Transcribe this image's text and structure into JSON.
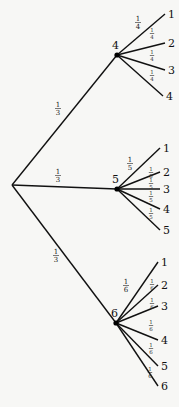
{
  "diagram": {
    "type": "probability-tree",
    "root": {
      "x": 12,
      "y": 185
    },
    "level1": [
      {
        "label": "4",
        "x": 117,
        "y": 55,
        "label_x": 112,
        "label_y": 49,
        "edge_prob": {
          "num": "1",
          "den": "3",
          "x": 58,
          "y": 108
        },
        "children": [
          {
            "label": "1",
            "x": 165,
            "y": 14,
            "prob": {
              "num": "1",
              "den": "4",
              "x": 138,
              "y": 22,
              "small": false
            }
          },
          {
            "label": "2",
            "x": 165,
            "y": 43,
            "prob": {
              "num": "1",
              "den": "4",
              "x": 152,
              "y": 33,
              "small": true
            }
          },
          {
            "label": "3",
            "x": 165,
            "y": 70,
            "prob": {
              "num": "1",
              "den": "4",
              "x": 152,
              "y": 55,
              "small": true
            }
          },
          {
            "label": "4",
            "x": 163,
            "y": 96,
            "prob": {
              "num": "1",
              "den": "4",
              "x": 152,
              "y": 75,
              "small": true
            }
          }
        ]
      },
      {
        "label": "5",
        "x": 117,
        "y": 189,
        "label_x": 112,
        "label_y": 183,
        "edge_prob": {
          "num": "1",
          "den": "3",
          "x": 58,
          "y": 175
        },
        "children": [
          {
            "label": "1",
            "x": 160,
            "y": 148,
            "prob": {
              "num": "1",
              "den": "5",
              "x": 130,
              "y": 163,
              "small": false
            }
          },
          {
            "label": "2",
            "x": 160,
            "y": 172,
            "prob": {
              "num": "1",
              "den": "5",
              "x": 151,
              "y": 172,
              "small": true
            }
          },
          {
            "label": "3",
            "x": 160,
            "y": 189,
            "prob": {
              "num": "1",
              "den": "5",
              "x": 151,
              "y": 183,
              "small": true
            }
          },
          {
            "label": "4",
            "x": 160,
            "y": 209,
            "prob": {
              "num": "1",
              "den": "5",
              "x": 151,
              "y": 196,
              "small": true
            }
          },
          {
            "label": "5",
            "x": 160,
            "y": 230,
            "prob": {
              "num": "1",
              "den": "5",
              "x": 151,
              "y": 213,
              "small": true
            }
          }
        ]
      },
      {
        "label": "6",
        "x": 116,
        "y": 323,
        "label_x": 111,
        "label_y": 317,
        "edge_prob": {
          "num": "1",
          "den": "3",
          "x": 56,
          "y": 255
        },
        "children": [
          {
            "label": "1",
            "x": 158,
            "y": 262,
            "prob": {
              "num": "1",
              "den": "6",
              "x": 126,
              "y": 285,
              "small": false
            }
          },
          {
            "label": "2",
            "x": 158,
            "y": 285,
            "prob": {
              "num": "1",
              "den": "6",
              "x": 152,
              "y": 284,
              "small": true
            }
          },
          {
            "label": "3",
            "x": 158,
            "y": 306,
            "prob": {
              "num": "1",
              "den": "6",
              "x": 152,
              "y": 303,
              "small": true
            }
          },
          {
            "label": "4",
            "x": 158,
            "y": 340,
            "prob": {
              "num": "1",
              "den": "6",
              "x": 151,
              "y": 325,
              "small": true
            }
          },
          {
            "label": "5",
            "x": 158,
            "y": 366,
            "prob": {
              "num": "1",
              "den": "6",
              "x": 151,
              "y": 348,
              "small": true
            }
          },
          {
            "label": "6",
            "x": 158,
            "y": 386,
            "prob": {
              "num": "1",
              "den": "6",
              "x": 150,
              "y": 372,
              "small": true
            }
          }
        ]
      }
    ]
  }
}
